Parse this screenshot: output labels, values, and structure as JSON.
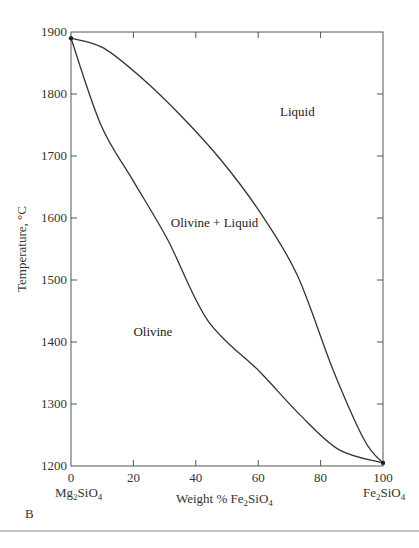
{
  "figure": {
    "panel_label": "B"
  },
  "chart_data": {
    "type": "line",
    "title": "",
    "xlabel": "Weight % Fe2SiO4",
    "ylabel": "Temperature, °C",
    "xlim": [
      0,
      100
    ],
    "ylim": [
      1200,
      1900
    ],
    "grid": false,
    "legend": "none",
    "x_ticks": [
      0,
      20,
      40,
      60,
      80,
      100
    ],
    "y_ticks": [
      1200,
      1300,
      1400,
      1500,
      1600,
      1700,
      1800,
      1900
    ],
    "x_end_labels": {
      "left": {
        "base": "Mg",
        "sub1": "2",
        "mid": "SiO",
        "sub2": "4"
      },
      "right": {
        "base": "Fe",
        "sub1": "2",
        "mid": "SiO",
        "sub2": "4"
      }
    },
    "xlabel_parts": {
      "pre": "Weight % Fe",
      "sub1": "2",
      "mid": "SiO",
      "sub2": "4"
    },
    "ylabel_text": "Temperature, °C",
    "series": [
      {
        "name": "Liquidus",
        "x": [
          0,
          10.5,
          23.3,
          36,
          48,
          60.5,
          72.5,
          84,
          94,
          100
        ],
        "y": [
          1890,
          1874,
          1823,
          1761,
          1694,
          1610,
          1508,
          1355,
          1242,
          1205
        ]
      },
      {
        "name": "Solidus",
        "x": [
          0,
          9.6,
          19.8,
          31,
          43.8,
          60.5,
          73.5,
          86,
          100
        ],
        "y": [
          1890,
          1750,
          1661,
          1565,
          1435,
          1352,
          1282,
          1226,
          1205
        ]
      }
    ],
    "annotations": [
      {
        "text": "Liquid",
        "x": 67,
        "y": 1765
      },
      {
        "text": "Olivine + Liquid",
        "x": 32,
        "y": 1585
      },
      {
        "text": "Olivine",
        "x": 20,
        "y": 1410
      }
    ]
  }
}
